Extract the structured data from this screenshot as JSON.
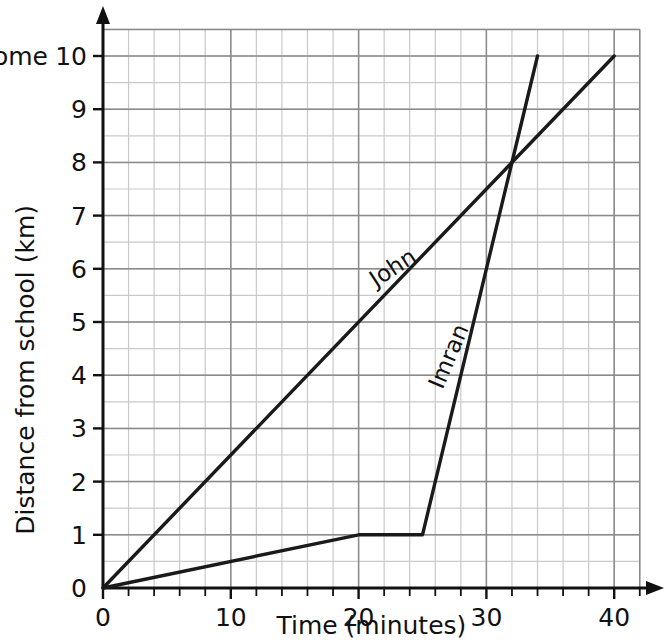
{
  "chart_data": {
    "type": "line",
    "title": "",
    "xlabel": "Time (minutes)",
    "ylabel": "Distance from school (km)",
    "xlim": [
      0,
      42
    ],
    "ylim": [
      0,
      10.5
    ],
    "xticks": [
      0,
      10,
      20,
      30,
      40
    ],
    "xtick_labels": [
      "0",
      "10",
      "20",
      "30",
      "40"
    ],
    "yticks": [
      0,
      1,
      2,
      3,
      4,
      5,
      6,
      7,
      8,
      9,
      10
    ],
    "ytick_labels": [
      "0",
      "1",
      "2",
      "3",
      "4",
      "5",
      "6",
      "7",
      "8",
      "9",
      "10"
    ],
    "grid": true,
    "grid_major_x_step": 10,
    "grid_minor_x_step": 2,
    "grid_major_y_step": 1,
    "grid_minor_y_step": 0.5,
    "axis_tick_step_x": 2,
    "legend": "inline-labels",
    "annotations": [
      {
        "text": "Home",
        "value": 10,
        "axis": "y",
        "position": "left-of-tick"
      }
    ],
    "series": [
      {
        "name": "John",
        "label": "John",
        "color": "#1a1a1a",
        "points": [
          {
            "x": 0,
            "y": 0
          },
          {
            "x": 40,
            "y": 10
          }
        ],
        "label_x": 23.0,
        "label_y": 5.9,
        "label_rotation": -33
      },
      {
        "name": "Imran",
        "label": "Imran",
        "color": "#1a1a1a",
        "points": [
          {
            "x": 0,
            "y": 0
          },
          {
            "x": 20,
            "y": 1
          },
          {
            "x": 25,
            "y": 1
          },
          {
            "x": 34,
            "y": 10
          }
        ],
        "label_x": 27.6,
        "label_y": 4.3,
        "label_rotation": -67
      }
    ],
    "intersection": {
      "x": 32,
      "y": 8
    },
    "colors": {
      "line": "#1a1a1a",
      "grid_major": "#8a8a8a",
      "grid_minor": "#c9c9c9",
      "axis": "#111111",
      "background": "#ffffff"
    }
  }
}
